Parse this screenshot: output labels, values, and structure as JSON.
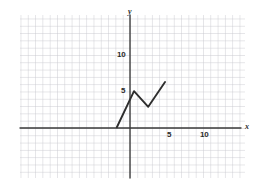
{
  "chart_data": {
    "type": "line",
    "title": "",
    "subtitle": "",
    "xlabel": "x",
    "ylabel": "y",
    "grid": true,
    "legend": false,
    "legend_position": "none",
    "xlim": [
      -15,
      15.7
    ],
    "ylim": [
      -6.8,
      15.5
    ],
    "x_ticks": [
      5,
      10
    ],
    "x_tick_labels": [
      "5",
      "10"
    ],
    "y_ticks": [
      5,
      10
    ],
    "y_tick_labels": [
      "5",
      "10"
    ],
    "grid_step": 1,
    "series": [
      {
        "name": "piecewise-linear-path",
        "color": "#2e2e2e",
        "x": [
          -1.8,
          0.55,
          2.5,
          4.8
        ],
        "y": [
          0.1,
          5.05,
          2.9,
          6.3
        ]
      }
    ],
    "annotations": []
  },
  "axes": {
    "x_axis_label": "x",
    "y_axis_label": "y",
    "x_tick_labels": [
      "5",
      "10"
    ],
    "y_tick_labels": [
      "10",
      "5"
    ]
  },
  "colors": {
    "background": "#ffffff",
    "grid": "#c9c9cf",
    "axis": "#3a3a3a",
    "curve": "#2e2e2e",
    "text": "#2b2b2b"
  }
}
